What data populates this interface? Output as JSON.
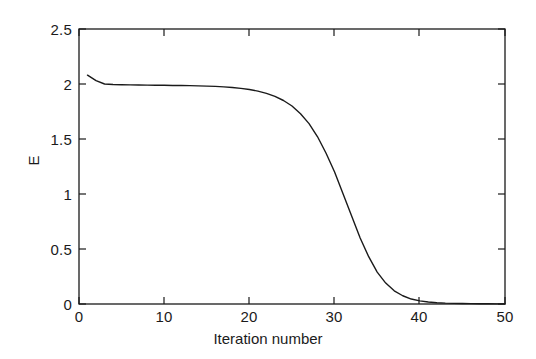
{
  "chart_data": {
    "type": "line",
    "title": "",
    "xlabel": "Iteration number",
    "ylabel": "E",
    "xlim": [
      0,
      50
    ],
    "ylim": [
      0,
      2.5
    ],
    "xticks": [
      0,
      10,
      20,
      30,
      40,
      50
    ],
    "xtick_labels": [
      "0",
      "10",
      "20",
      "30",
      "40",
      "50"
    ],
    "yticks": [
      0,
      0.5,
      1,
      1.5,
      2,
      2.5
    ],
    "ytick_labels": [
      "0",
      "0.5",
      "1",
      "1.5",
      "2",
      "2.5"
    ],
    "grid": false,
    "legend": null,
    "line_color": "#1a1a1a",
    "line_width": 1.4,
    "series": [
      {
        "name": "E",
        "x": [
          1,
          2,
          3,
          4,
          5,
          6,
          7,
          8,
          9,
          10,
          11,
          12,
          13,
          14,
          15,
          16,
          17,
          18,
          19,
          20,
          21,
          22,
          23,
          24,
          25,
          26,
          27,
          28,
          29,
          30,
          31,
          32,
          33,
          34,
          35,
          36,
          37,
          38,
          39,
          40,
          41,
          42,
          43,
          44,
          45,
          46,
          47,
          48,
          49,
          50
        ],
        "values": [
          2.08,
          2.03,
          2.0,
          1.995,
          1.993,
          1.992,
          1.991,
          1.99,
          1.989,
          1.988,
          1.987,
          1.986,
          1.985,
          1.983,
          1.981,
          1.978,
          1.974,
          1.968,
          1.96,
          1.95,
          1.935,
          1.915,
          1.888,
          1.85,
          1.8,
          1.73,
          1.64,
          1.52,
          1.37,
          1.2,
          1.0,
          0.8,
          0.6,
          0.43,
          0.29,
          0.19,
          0.12,
          0.075,
          0.045,
          0.028,
          0.018,
          0.012,
          0.008,
          0.006,
          0.004,
          0.003,
          0.002,
          0.002,
          0.001,
          0.001
        ]
      }
    ],
    "axes_box": {
      "left_px": 79,
      "right_px": 505,
      "top_px": 29,
      "bottom_px": 304
    }
  }
}
